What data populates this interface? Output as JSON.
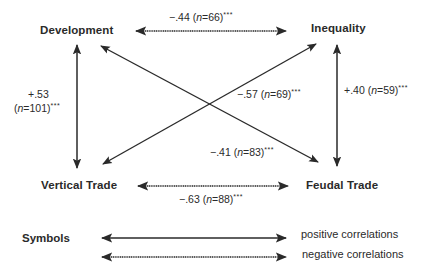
{
  "nodes": {
    "development": "Development",
    "inequality": "Inequality",
    "vertical_trade": "Vertical Trade",
    "feudal_trade": "Feudal Trade"
  },
  "correlations": [
    {
      "from": "Development",
      "to": "Inequality",
      "r": "−.44",
      "n": "66",
      "sig": "***",
      "sign": "negative"
    },
    {
      "from": "Development",
      "to": "Vertical Trade",
      "r": "+.53",
      "n": "101",
      "sig": "***",
      "sign": "positive"
    },
    {
      "from": "Inequality",
      "to": "Feudal Trade",
      "r": "+.40",
      "n": "59",
      "sig": "***",
      "sign": "positive"
    },
    {
      "from": "Inequality",
      "to": "Vertical Trade",
      "r": "−.57",
      "n": "69",
      "sig": "***",
      "sign": "negative"
    },
    {
      "from": "Development",
      "to": "Feudal Trade",
      "r": "−.41",
      "n": "83",
      "sig": "***",
      "sign": "negative"
    },
    {
      "from": "Vertical Trade",
      "to": "Feudal Trade",
      "r": "−.63",
      "n": "88",
      "sig": "***",
      "sign": "negative"
    }
  ],
  "labels": {
    "dev_ineq": {
      "r": "−.44",
      "open": " (",
      "n_sym": "n",
      "eq": "=66)",
      "sig": "***"
    },
    "dev_vt_r": "+.53",
    "dev_vt": {
      "open": "(",
      "n_sym": "n",
      "eq": "=101)",
      "sig": "***"
    },
    "ineq_ft": {
      "r": "+.40",
      "open": " (",
      "n_sym": "n",
      "eq": "=59)",
      "sig": "***"
    },
    "ineq_vt": {
      "r": "−.57",
      "open": " (",
      "n_sym": "n",
      "eq": "=69)",
      "sig": "***"
    },
    "dev_ft": {
      "r": "−.41",
      "open": " (",
      "n_sym": "n",
      "eq": "=83)",
      "sig": "***"
    },
    "vt_ft": {
      "r": "−.63",
      "open": " (",
      "n_sym": "n",
      "eq": "=88)",
      "sig": "***"
    }
  },
  "legend": {
    "title": "Symbols",
    "positive": "positive correlations",
    "negative": "negative correlations"
  },
  "colors": {
    "line": "#2a2a2a",
    "background": "#ffffff"
  }
}
